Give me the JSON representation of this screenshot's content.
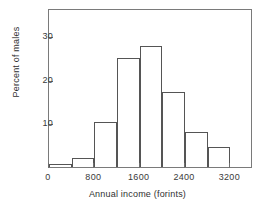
{
  "chart_data": {
    "type": "bar",
    "title": "",
    "xlabel": "Annual income (forints)",
    "ylabel": "Percent of males",
    "grid": false,
    "legend": null,
    "xlim": [
      0,
      3600
    ],
    "ylim": [
      0,
      36.5
    ],
    "bin_width": 400,
    "xticks": [
      0,
      800,
      1600,
      2400,
      3200
    ],
    "xtick_labels": [
      "0",
      "800",
      "1600",
      "2400",
      "3200"
    ],
    "yticks": [
      10,
      20,
      30
    ],
    "ytick_labels": [
      "10",
      "20",
      "30"
    ],
    "bins": [
      {
        "x0": 0,
        "x1": 400,
        "value": 0.8
      },
      {
        "x0": 400,
        "x1": 800,
        "value": 2.0
      },
      {
        "x0": 800,
        "x1": 1200,
        "value": 10.3
      },
      {
        "x0": 1200,
        "x1": 1600,
        "value": 25.0
      },
      {
        "x0": 1600,
        "x1": 2000,
        "value": 27.8
      },
      {
        "x0": 2000,
        "x1": 2400,
        "value": 17.3
      },
      {
        "x0": 2400,
        "x1": 2800,
        "value": 8.0
      },
      {
        "x0": 2800,
        "x1": 3200,
        "value": 4.6
      }
    ],
    "categories": [
      "0-400",
      "400-800",
      "800-1200",
      "1200-1600",
      "1600-2000",
      "2000-2400",
      "2400-2800",
      "2800-3200"
    ],
    "values": [
      0.8,
      2.0,
      10.3,
      25.0,
      27.8,
      17.3,
      8.0,
      4.6
    ],
    "colors": {
      "bar_stroke": "#555555",
      "axis": "#7a7a7a",
      "text": "#2a2a2a",
      "background": "#ffffff"
    }
  }
}
